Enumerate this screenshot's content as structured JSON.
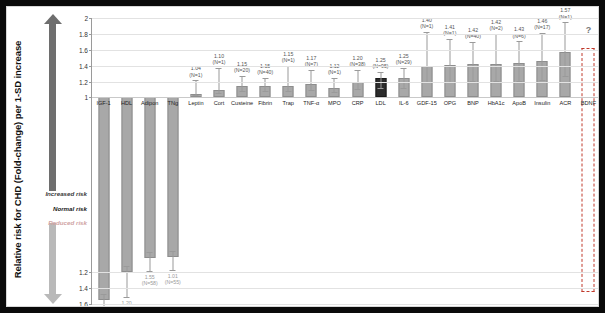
{
  "axis": {
    "title": "Relative risk for CHD (Fold-change) per 1-SD increase",
    "ticks_upper": [
      "2",
      "1.8",
      "1.6",
      "1.4",
      "1.2",
      "1"
    ],
    "ticks_lower": [
      "1.2",
      "1.4",
      "1.6"
    ]
  },
  "legend": {
    "increased": "Increased risk",
    "normal": "Normal risk",
    "reduced": "Reduced risk"
  },
  "colors": {
    "bar": "#a8a8a8",
    "bar_highlight": "#2b2b2b",
    "bar_unknown_outline": "#c0392b",
    "arrow_up": "#6e6e6e",
    "arrow_down": "#b9b9b9",
    "grid": "#e2e2e2"
  },
  "unknown_marker": "?",
  "chart_data": {
    "type": "bar",
    "title": "",
    "xlabel": "",
    "ylabel": "Relative risk for CHD (Fold-change) per 1-SD increase",
    "ylim": [
      -1.6,
      2.0
    ],
    "grid": true,
    "legend_position": "left",
    "categories": [
      "IGF-1",
      "HDL",
      "Adipon",
      "TNg",
      "Leptin",
      "Cort",
      "Custeine",
      "Fibrin",
      "Trap",
      "TNF-α",
      "MPO",
      "CRP",
      "LDL",
      "IL-6",
      "GDF-15",
      "OPG",
      "BNP",
      "HbA1c",
      "ApoB",
      "Insulin",
      "ACR",
      "BDNF"
    ],
    "values": [
      -1.55,
      -1.2,
      -1.02,
      -1.01,
      1.04,
      1.1,
      1.15,
      1.15,
      1.15,
      1.17,
      1.12,
      1.2,
      1.25,
      1.25,
      1.4,
      1.41,
      1.42,
      1.42,
      1.43,
      1.46,
      1.57,
      null
    ],
    "value_labels": [
      "1.55",
      "1.20",
      "1.55",
      "1.01",
      "1.04",
      "1.10",
      "1.15",
      "1.15",
      "1.15",
      "1.17",
      "1.12",
      "1.20",
      "1.25",
      "1.25",
      "1.40",
      "1.41",
      "1.42",
      "1.42",
      "1.43",
      "1.46",
      "1.57",
      "?"
    ],
    "n_labels": [
      "(N=3)",
      "(N=58)",
      "(N=58)",
      "(N=55)",
      "(N=1)",
      "(N=1)",
      "(N=20)",
      "(N=40)",
      "(N=1)",
      "(N=7)",
      "(N=1)",
      "(N=38)",
      "(N=95)",
      "(N=29)",
      "(N=1)",
      "(N=1)",
      "(N=40)",
      "(N=2)",
      "(N=6)",
      "(N=17)",
      "(N=1)",
      ""
    ],
    "highlight_index": 12,
    "unknown_index": 21
  }
}
